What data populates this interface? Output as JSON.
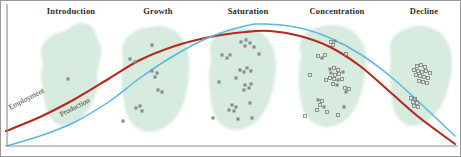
{
  "figure": {
    "width": 461,
    "height": 157,
    "background": "#ffffff",
    "border_color": "#9a9a9a",
    "axis_color": "#8d8d8d"
  },
  "colors": {
    "employment_curve": "#b5291f",
    "production_curve": "#5bb8e0",
    "region_fill": "#d8ebdf",
    "region_edge": "#c3e0cd",
    "marker_filled": "#8a8a8a",
    "marker_hollow_edge": "#7d7d7d",
    "title_text": "#2b2b2b",
    "label_text": "#3a3a3a"
  },
  "stage_titles": [
    {
      "label": "Introduction",
      "x": 71,
      "y": 6
    },
    {
      "label": "Growth",
      "x": 158,
      "y": 6
    },
    {
      "label": "Saturation",
      "x": 248,
      "y": 6
    },
    {
      "label": "Concentration",
      "x": 337,
      "y": 6
    },
    {
      "label": "Decline",
      "x": 424,
      "y": 6
    }
  ],
  "curve_labels": [
    {
      "label": "Employment",
      "x": 9,
      "y": 103,
      "rotation": -27,
      "series": "employment"
    },
    {
      "label": "Production",
      "x": 60,
      "y": 110,
      "rotation": -27,
      "series": "production"
    }
  ],
  "chart_data": {
    "type": "line",
    "title": "",
    "xlabel": "",
    "ylabel": "",
    "grid": false,
    "legend_position": "inline-on-curve",
    "xlim": [
      0,
      461
    ],
    "ylim": [
      157,
      0
    ],
    "x_categories": [
      "Introduction",
      "Growth",
      "Saturation",
      "Concentration",
      "Decline"
    ],
    "series": [
      {
        "name": "Employment",
        "color": "#b5291f",
        "points": [
          [
            6,
            131
          ],
          [
            40,
            117
          ],
          [
            75,
            99
          ],
          [
            110,
            78
          ],
          [
            140,
            60
          ],
          [
            175,
            46
          ],
          [
            210,
            37
          ],
          [
            245,
            32
          ],
          [
            270,
            31
          ],
          [
            300,
            36
          ],
          [
            330,
            47
          ],
          [
            360,
            66
          ],
          [
            390,
            92
          ],
          [
            420,
            118
          ],
          [
            455,
            144
          ]
        ]
      },
      {
        "name": "Production",
        "color": "#5bb8e0",
        "points": [
          [
            6,
            146
          ],
          [
            40,
            136
          ],
          [
            75,
            122
          ],
          [
            110,
            101
          ],
          [
            140,
            78
          ],
          [
            175,
            55
          ],
          [
            210,
            37
          ],
          [
            245,
            26
          ],
          [
            265,
            24
          ],
          [
            300,
            28
          ],
          [
            330,
            38
          ],
          [
            360,
            54
          ],
          [
            390,
            76
          ],
          [
            420,
            103
          ],
          [
            455,
            136
          ]
        ]
      }
    ],
    "regions": [
      {
        "stage": "Introduction",
        "marker_style": "filled",
        "marker_count": 1,
        "centroid": [
          70,
          78
        ],
        "outline": [
          [
            44,
            64
          ],
          [
            42,
            50
          ],
          [
            48,
            40
          ],
          [
            57,
            34
          ],
          [
            66,
            32
          ],
          [
            74,
            26
          ],
          [
            84,
            24
          ],
          [
            92,
            29
          ],
          [
            96,
            38
          ],
          [
            100,
            48
          ],
          [
            99,
            60
          ],
          [
            96,
            72
          ],
          [
            97,
            84
          ],
          [
            94,
            96
          ],
          [
            88,
            108
          ],
          [
            80,
            118
          ],
          [
            70,
            124
          ],
          [
            60,
            124
          ],
          [
            52,
            118
          ],
          [
            47,
            108
          ],
          [
            45,
            96
          ],
          [
            43,
            84
          ],
          [
            42,
            74
          ]
        ],
        "markers": [
          [
            68,
            79
          ]
        ]
      },
      {
        "stage": "Growth",
        "marker_style": "filled",
        "marker_count": 11,
        "centroid": [
          157,
          78
        ],
        "outline": [
          [
            124,
            60
          ],
          [
            123,
            48
          ],
          [
            128,
            38
          ],
          [
            138,
            31
          ],
          [
            150,
            28
          ],
          [
            162,
            27
          ],
          [
            173,
            31
          ],
          [
            181,
            38
          ],
          [
            186,
            48
          ],
          [
            188,
            60
          ],
          [
            188,
            74
          ],
          [
            186,
            88
          ],
          [
            183,
            102
          ],
          [
            177,
            114
          ],
          [
            168,
            124
          ],
          [
            156,
            130
          ],
          [
            144,
            130
          ],
          [
            134,
            124
          ],
          [
            128,
            114
          ],
          [
            125,
            102
          ],
          [
            123,
            88
          ],
          [
            123,
            74
          ]
        ],
        "markers": [
          [
            152,
            45
          ],
          [
            130,
            59
          ],
          [
            135,
            62
          ],
          [
            152,
            71
          ],
          [
            157,
            73
          ],
          [
            155,
            77
          ],
          [
            158,
            90
          ],
          [
            162,
            92
          ],
          [
            136,
            108
          ],
          [
            140,
            106
          ],
          [
            142,
            111
          ],
          [
            123,
            121
          ]
        ]
      },
      {
        "stage": "Saturation",
        "marker_style": "filled",
        "marker_count": 25,
        "centroid": [
          248,
          80
        ],
        "outline": [
          [
            212,
            58
          ],
          [
            211,
            46
          ],
          [
            216,
            37
          ],
          [
            226,
            31
          ],
          [
            238,
            29
          ],
          [
            250,
            30
          ],
          [
            261,
            34
          ],
          [
            269,
            42
          ],
          [
            273,
            52
          ],
          [
            275,
            64
          ],
          [
            274,
            78
          ],
          [
            271,
            92
          ],
          [
            266,
            106
          ],
          [
            258,
            118
          ],
          [
            248,
            126
          ],
          [
            236,
            129
          ],
          [
            225,
            126
          ],
          [
            217,
            118
          ],
          [
            213,
            106
          ],
          [
            211,
            92
          ],
          [
            210,
            76
          ],
          [
            211,
            66
          ]
        ],
        "markers": [
          [
            241,
            42
          ],
          [
            246,
            40
          ],
          [
            250,
            43
          ],
          [
            245,
            46
          ],
          [
            254,
            47
          ],
          [
            222,
            55
          ],
          [
            227,
            58
          ],
          [
            230,
            55
          ],
          [
            259,
            54
          ],
          [
            240,
            70
          ],
          [
            244,
            72
          ],
          [
            247,
            68
          ],
          [
            251,
            71
          ],
          [
            236,
            78
          ],
          [
            219,
            82
          ],
          [
            245,
            85
          ],
          [
            249,
            88
          ],
          [
            251,
            84
          ],
          [
            244,
            90
          ],
          [
            232,
            105
          ],
          [
            236,
            107
          ],
          [
            229,
            110
          ],
          [
            234,
            111
          ],
          [
            250,
            103
          ],
          [
            238,
            119
          ],
          [
            213,
            118
          ],
          [
            252,
            118
          ]
        ]
      },
      {
        "stage": "Concentration",
        "marker_style": "mixed",
        "marker_count": 28,
        "centroid": [
          337,
          78
        ],
        "outline": [
          [
            302,
            56
          ],
          [
            301,
            44
          ],
          [
            306,
            35
          ],
          [
            316,
            29
          ],
          [
            328,
            26
          ],
          [
            340,
            27
          ],
          [
            351,
            31
          ],
          [
            359,
            39
          ],
          [
            364,
            50
          ],
          [
            365,
            62
          ],
          [
            364,
            76
          ],
          [
            361,
            90
          ],
          [
            356,
            104
          ],
          [
            348,
            116
          ],
          [
            337,
            124
          ],
          [
            325,
            126
          ],
          [
            314,
            122
          ],
          [
            306,
            114
          ],
          [
            302,
            102
          ],
          [
            300,
            88
          ],
          [
            300,
            72
          ],
          [
            301,
            62
          ]
        ],
        "markers": [
          [
            331,
            42
          ],
          [
            335,
            41
          ],
          [
            333,
            45
          ],
          [
            318,
            56
          ],
          [
            322,
            58
          ],
          [
            325,
            55
          ],
          [
            346,
            54
          ],
          [
            330,
            69
          ],
          [
            334,
            68
          ],
          [
            338,
            70
          ],
          [
            331,
            73
          ],
          [
            335,
            75
          ],
          [
            339,
            74
          ],
          [
            343,
            72
          ],
          [
            330,
            78
          ],
          [
            334,
            79
          ],
          [
            338,
            80
          ],
          [
            342,
            79
          ],
          [
            333,
            84
          ],
          [
            337,
            85
          ],
          [
            345,
            88
          ],
          [
            349,
            89
          ],
          [
            346,
            92
          ],
          [
            310,
            75
          ],
          [
            326,
            80
          ],
          [
            318,
            100
          ],
          [
            322,
            101
          ],
          [
            320,
            105
          ],
          [
            324,
            107
          ],
          [
            317,
            110
          ],
          [
            327,
            112
          ],
          [
            344,
            107
          ],
          [
            305,
            116
          ],
          [
            338,
            115
          ]
        ]
      },
      {
        "stage": "Decline",
        "marker_style": "hollow",
        "marker_count": 18,
        "centroid": [
          423,
          78
        ],
        "outline": [
          [
            392,
            58
          ],
          [
            391,
            46
          ],
          [
            396,
            36
          ],
          [
            405,
            30
          ],
          [
            416,
            27
          ],
          [
            428,
            28
          ],
          [
            439,
            33
          ],
          [
            446,
            42
          ],
          [
            450,
            53
          ],
          [
            451,
            66
          ],
          [
            449,
            80
          ],
          [
            445,
            94
          ],
          [
            439,
            107
          ],
          [
            430,
            118
          ],
          [
            419,
            124
          ],
          [
            408,
            124
          ],
          [
            399,
            117
          ],
          [
            394,
            106
          ],
          [
            392,
            92
          ],
          [
            391,
            76
          ],
          [
            391,
            66
          ]
        ],
        "markers": [
          [
            417,
            66
          ],
          [
            421,
            65
          ],
          [
            425,
            67
          ],
          [
            414,
            70
          ],
          [
            418,
            71
          ],
          [
            422,
            72
          ],
          [
            426,
            71
          ],
          [
            430,
            73
          ],
          [
            416,
            75
          ],
          [
            420,
            76
          ],
          [
            424,
            77
          ],
          [
            428,
            78
          ],
          [
            419,
            81
          ],
          [
            423,
            82
          ],
          [
            427,
            83
          ],
          [
            411,
            98
          ],
          [
            415,
            99
          ],
          [
            413,
            102
          ],
          [
            417,
            103
          ],
          [
            414,
            106
          ],
          [
            418,
            107
          ]
        ]
      }
    ]
  }
}
